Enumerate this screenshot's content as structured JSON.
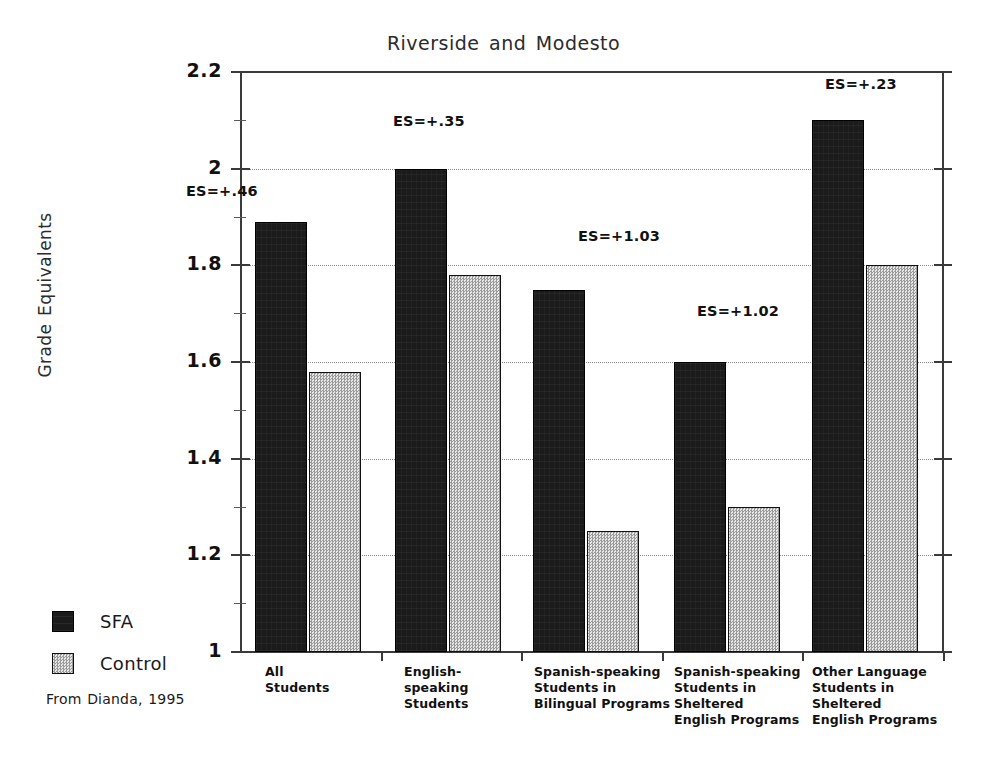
{
  "chart_data": {
    "type": "bar",
    "title": "Riverside and Modesto",
    "xlabel": "",
    "ylabel": "Grade Equivalents",
    "ylim": [
      1,
      2.2
    ],
    "ytick_labels": [
      "1",
      "1.2",
      "1.4",
      "1.6",
      "1.8",
      "2",
      "2.2"
    ],
    "ytick_values": [
      1,
      1.2,
      1.4,
      1.6,
      1.8,
      2,
      2.2
    ],
    "grid": true,
    "legend_position": "left-bottom",
    "categories": [
      "All\nStudents",
      "English-\nspeaking\nStudents",
      "Spanish-speaking\nStudents in\nBilingual Programs",
      "Spanish-speaking\nStudents in\nSheltered\nEnglish Programs",
      "Other Language\nStudents in\nSheltered\nEnglish Programs"
    ],
    "series": [
      {
        "name": "SFA",
        "color": "#1b1b1b",
        "values": [
          1.89,
          2.0,
          1.75,
          1.6,
          2.1
        ]
      },
      {
        "name": "Control",
        "color": "#cfcfcf",
        "values": [
          1.58,
          1.78,
          1.25,
          1.3,
          1.8
        ]
      }
    ],
    "annotations": [
      {
        "text": "ES=+.46",
        "group": 0
      },
      {
        "text": "ES=+.35",
        "group": 1
      },
      {
        "text": "ES=+1.03",
        "group": 2
      },
      {
        "text": "ES=+1.02",
        "group": 3
      },
      {
        "text": "ES=+.23",
        "group": 4
      }
    ],
    "source": "From Dianda, 1995"
  },
  "title": "Riverside and Modesto",
  "y_axis": {
    "title": "Grade Equivalents",
    "labels": [
      "2.2",
      "2",
      "1.8",
      "1.6",
      "1.4",
      "1.2",
      "1"
    ]
  },
  "legend": {
    "items": [
      {
        "label": "SFA",
        "swatch": "dark-solid-swatch"
      },
      {
        "label": "Control",
        "swatch": "light-dotted-swatch"
      }
    ]
  },
  "categories": [
    "All\nStudents",
    "English-\nspeaking\nStudents",
    "Spanish-speaking\nStudents in\nBilingual Programs",
    "Spanish-speaking\nStudents in\nSheltered\nEnglish Programs",
    "Other Language\nStudents in\nSheltered\nEnglish Programs"
  ],
  "annotations": [
    "ES=+.46",
    "ES=+.35",
    "ES=+1.03",
    "ES=+1.02",
    "ES=+.23"
  ],
  "source_note": "From Dianda, 1995"
}
